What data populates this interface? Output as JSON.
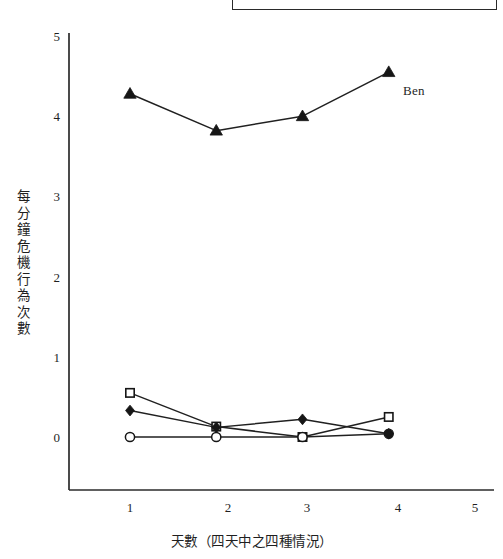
{
  "chart_data": {
    "type": "line",
    "title": "",
    "xlabel": "天數（四天中之四種情況）",
    "ylabel": "每分鐘危機行為次數",
    "x": [
      1,
      2,
      3,
      4
    ],
    "xticks": [
      1,
      2,
      3,
      4,
      5
    ],
    "yticks": [
      0,
      1,
      2,
      3,
      4,
      5
    ],
    "xlim": [
      0,
      5.35
    ],
    "ylim": [
      0,
      5
    ],
    "grid": false,
    "legend": "inline-annotation",
    "annotations": [
      {
        "text": "Ben",
        "x": 4.35,
        "y": 4.4
      }
    ],
    "series": [
      {
        "name": "Ben",
        "marker": "filled-triangle",
        "values": [
          4.28,
          3.82,
          4.0,
          4.55
        ]
      },
      {
        "name": "series-open-square",
        "marker": "open-square",
        "values": [
          0.55,
          0.13,
          0.0,
          0.25
        ]
      },
      {
        "name": "series-filled-diamond",
        "marker": "filled-diamond",
        "values": [
          0.33,
          0.12,
          0.22,
          0.04
        ]
      },
      {
        "name": "series-open-circle",
        "marker": "open-circle",
        "values": [
          0.0,
          0.0,
          0.0,
          0.04
        ]
      }
    ]
  },
  "axis": {
    "ytick_labels": [
      "5",
      "4",
      "3",
      "2",
      "1",
      "0"
    ],
    "xtick_labels": [
      "1",
      "2",
      "3",
      "4",
      "5"
    ]
  },
  "labels": {
    "y_axis_title": "每分鐘危機行為次數",
    "x_axis_title": "天數（四天中之四種情況）",
    "ben": "Ben"
  },
  "colors": {
    "ink": "#1f1f1f",
    "line": "#222222",
    "background": "#ffffff"
  }
}
